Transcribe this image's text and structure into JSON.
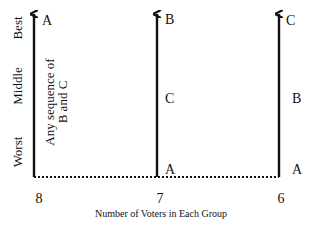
{
  "diagram": {
    "y_axis_labels": {
      "best": "Best",
      "middle": "Middle",
      "worst": "Worst"
    },
    "x_axis_caption": "Number of Voters in Each Group",
    "groups": [
      {
        "voters": "8",
        "best": "A",
        "note_line1": "Any sequence of",
        "note_line2": "B and C"
      },
      {
        "voters": "7",
        "best": "B",
        "middle": "C",
        "worst": "A"
      },
      {
        "voters": "6",
        "best": "C",
        "middle": "B",
        "worst": "A"
      }
    ],
    "colors": {
      "line": "#111111",
      "background": "#ffffff"
    }
  }
}
